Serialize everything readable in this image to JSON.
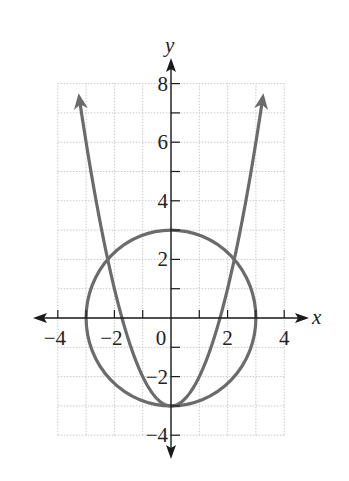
{
  "chart_data": {
    "type": "line",
    "title": "",
    "xlabel": "x",
    "ylabel": "y",
    "xlim": [
      -4,
      4
    ],
    "ylim": [
      -4,
      8
    ],
    "grid": true,
    "legend": null,
    "x_ticks": [
      -4,
      -2,
      0,
      2,
      4
    ],
    "x_tick_labels": [
      "−4",
      "−2",
      "0",
      "2",
      "4"
    ],
    "y_ticks": [
      -4,
      -2,
      2,
      4,
      6,
      8
    ],
    "y_tick_labels": [
      "−4",
      "−2",
      "2",
      "4",
      "6",
      "8"
    ],
    "series": [
      {
        "name": "circle",
        "equation": "x^2 + y^2 = 9",
        "shape": "circle",
        "center": [
          0,
          0
        ],
        "radius": 3
      },
      {
        "name": "parabola",
        "equation": "y = x^2 - 3",
        "x": [
          -3.3,
          -3,
          -2.236,
          -2,
          -1,
          0,
          1,
          2,
          2.236,
          3,
          3.3
        ],
        "y": [
          7.89,
          6,
          2,
          1,
          -2,
          -3,
          -2,
          1,
          2,
          6,
          7.89
        ],
        "arrows": "both ends"
      }
    ],
    "intersections": [
      [
        -2.236,
        2
      ],
      [
        0,
        -3
      ],
      [
        2.236,
        2
      ]
    ]
  },
  "colors": {
    "curve": "#6b6b6b",
    "axis": "#1a1a1a",
    "grid": "#c8c8c8"
  }
}
